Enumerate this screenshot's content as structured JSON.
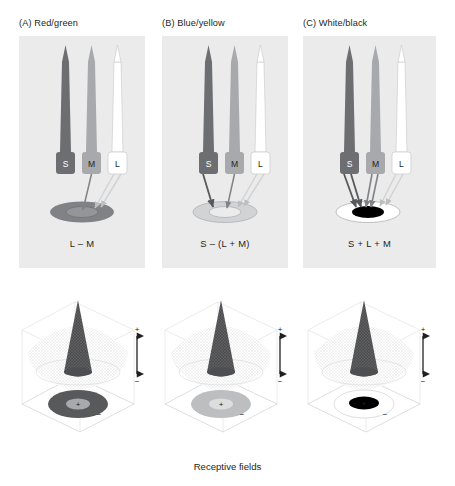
{
  "figure": {
    "caption": "Receptive fields",
    "background": "#ffffff",
    "panel_background": "#ebebeb"
  },
  "panels": [
    {
      "id": "A",
      "title": "(A) Red/green",
      "formula": "L – M",
      "opponency": "red-green",
      "cones": [
        {
          "name": "S",
          "label": "S",
          "color": "#6d6e71",
          "text_color": "#ffffff",
          "connected": false
        },
        {
          "name": "M",
          "label": "M",
          "color": "#a7a9ac",
          "text_color": "#231f20",
          "connected": true,
          "sign": "-"
        },
        {
          "name": "L",
          "label": "L",
          "color": "#ffffff",
          "text_color": "#231f20",
          "connected": true,
          "sign": "+"
        }
      ],
      "ganglion": {
        "fill": "#808285",
        "center_fill": "#939598",
        "center_mark": ""
      },
      "receptive_field": {
        "center_sign": "+",
        "surround_sign": "−",
        "disc_color": "#58595b",
        "core_color": "#a7a9ac",
        "peak_color": "#58595b",
        "contour_mark": "−"
      }
    },
    {
      "id": "B",
      "title": "(B) Blue/yellow",
      "formula": "S – (L + M)",
      "opponency": "blue-yellow",
      "cones": [
        {
          "name": "S",
          "label": "S",
          "color": "#6d6e71",
          "text_color": "#ffffff",
          "connected": true,
          "sign": "+"
        },
        {
          "name": "M",
          "label": "M",
          "color": "#a7a9ac",
          "text_color": "#231f20",
          "connected": true,
          "sign": "-"
        },
        {
          "name": "L",
          "label": "L",
          "color": "#ffffff",
          "text_color": "#231f20",
          "connected": true,
          "sign": "-"
        }
      ],
      "ganglion": {
        "fill": "#d1d3d4",
        "center_fill": "#e6e7e8",
        "center_mark": ""
      },
      "receptive_field": {
        "center_sign": "+",
        "surround_sign": "−",
        "disc_color": "#bcbec0",
        "core_color": "#d9dadb",
        "peak_color": "#58595b",
        "contour_mark": "−"
      }
    },
    {
      "id": "C",
      "title": "(C) White/black",
      "formula": "S + L + M",
      "opponency": "white-black",
      "cones": [
        {
          "name": "S",
          "label": "S",
          "color": "#6d6e71",
          "text_color": "#ffffff",
          "connected": true,
          "sign": "+"
        },
        {
          "name": "M",
          "label": "M",
          "color": "#a7a9ac",
          "text_color": "#231f20",
          "connected": true,
          "sign": "+"
        },
        {
          "name": "L",
          "label": "L",
          "color": "#ffffff",
          "text_color": "#231f20",
          "connected": true,
          "sign": "+"
        }
      ],
      "ganglion": {
        "fill": "#ffffff",
        "center_fill": "#000000",
        "center_mark": ""
      },
      "receptive_field": {
        "center_sign": "+",
        "surround_sign": "−",
        "disc_color": "#ffffff",
        "core_color": "#000000",
        "peak_color": "#58595b",
        "contour_mark": "−"
      }
    }
  ],
  "axis": {
    "plus_label": "+",
    "minus_label": "−"
  }
}
